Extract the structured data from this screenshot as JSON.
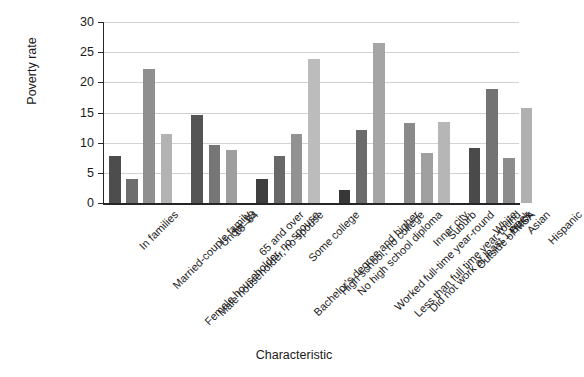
{
  "chart_data": {
    "type": "bar",
    "title": "",
    "xlabel": "Characteristic",
    "ylabel": "Poverty rate",
    "ylim": [
      0,
      30
    ],
    "yticks": [
      0,
      5,
      10,
      15,
      20,
      25,
      30
    ],
    "grid": true,
    "legend": "none",
    "orientation": "vertical",
    "xtick_rotation": -45,
    "categories": [
      "In families",
      "Married-couple family",
      "Female householder, no spouse",
      "Male householder, no spouse",
      "Under 18",
      "18–64",
      "65 and over",
      "Bachelor's degree and higher",
      "Some college",
      "High school, no college",
      "No high school diploma",
      "Worked full-time year-round",
      "Less than full time year-round",
      "Did not work at least 1 week",
      "Inner city",
      "Suburb",
      "Outside of MSA",
      "White",
      "Black",
      "Asian",
      "Hispanic"
    ],
    "values": [
      7.8,
      4.0,
      22.2,
      11.5,
      14.6,
      9.6,
      8.8,
      3.9,
      7.8,
      11.5,
      23.8,
      2.1,
      12.1,
      26.5,
      13.2,
      8.3,
      13.4,
      9.2,
      18.9,
      7.4,
      15.8
    ],
    "groups": [
      {
        "name": "Family type",
        "start": 0,
        "count": 4
      },
      {
        "name": "Age",
        "start": 4,
        "count": 3
      },
      {
        "name": "Education",
        "start": 7,
        "count": 4
      },
      {
        "name": "Work experience",
        "start": 11,
        "count": 3
      },
      {
        "name": "Residence",
        "start": 14,
        "count": 3
      },
      {
        "name": "Race and ethnicity",
        "start": 17,
        "count": 4
      }
    ],
    "bar_colors": [
      "#4d4d4d",
      "#6e6e6e",
      "#8f8f8f",
      "#b3b3b3",
      "#545454",
      "#767676",
      "#9e9e9e",
      "#3f3f3f",
      "#686868",
      "#929292",
      "#bcbcbc",
      "#373737",
      "#6b6b6b",
      "#a5a5a5",
      "#8a8a8a",
      "#a0a0a0",
      "#b6b6b6",
      "#4a4a4a",
      "#737373",
      "#8c8c8c",
      "#b0b0b0"
    ],
    "colors": {
      "background": "#ffffff",
      "axis": "#262626",
      "gridline": "#d2d2d2",
      "text": "#1a1a1a"
    }
  }
}
